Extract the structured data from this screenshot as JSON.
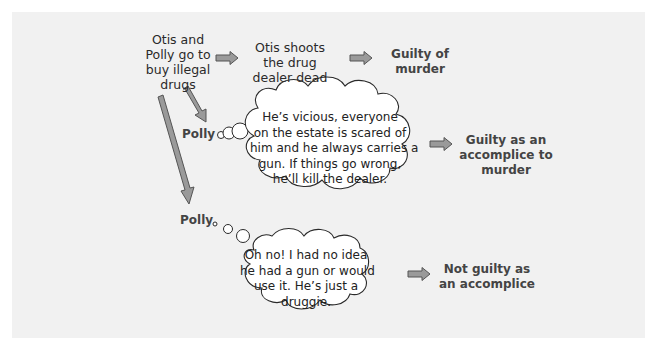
{
  "diagram": {
    "colors": {
      "panel_background": "#f1f1f1",
      "arrow_fill": "#9a9a9a",
      "arrow_stroke": "#555555",
      "cloud_fill": "#ffffff",
      "cloud_stroke": "#2a2a2a",
      "text": "#2a2a2a",
      "verdict_text": "#444444"
    },
    "start": {
      "lines": [
        "Otis and",
        "Polly go to",
        "buy illegal",
        "drugs"
      ]
    },
    "path_top": {
      "event_lines": [
        "Otis shoots",
        "the drug",
        "dealer dead"
      ],
      "verdict_lines": [
        "Guilty of",
        "murder"
      ]
    },
    "path_middle": {
      "speaker": "Polly",
      "thought_lines": [
        "He’s vicious, everyone",
        "on the estate is scared of",
        "him and he always carries a",
        "gun. If things go wrong,",
        "he’ll kill the dealer."
      ],
      "verdict_lines": [
        "Guilty as an",
        "accomplice to",
        "murder"
      ]
    },
    "path_bottom": {
      "speaker": "Polly",
      "thought_lines": [
        "Oh no! I had no idea",
        "he had a gun or would",
        "use it. He’s just a",
        "druggie."
      ],
      "verdict_lines": [
        "Not guilty as",
        "an accomplice"
      ]
    },
    "arrows": [
      {
        "name": "start-to-event",
        "icon": "right-arrow-icon"
      },
      {
        "name": "event-to-verdict-murder",
        "icon": "right-arrow-icon"
      },
      {
        "name": "start-to-polly-accomplice",
        "icon": "diagonal-arrow-icon"
      },
      {
        "name": "accomplice-thought-to-verdict",
        "icon": "right-arrow-icon"
      },
      {
        "name": "start-to-polly-unaware",
        "icon": "diagonal-arrow-icon"
      },
      {
        "name": "unaware-thought-to-verdict",
        "icon": "right-arrow-icon"
      }
    ]
  }
}
